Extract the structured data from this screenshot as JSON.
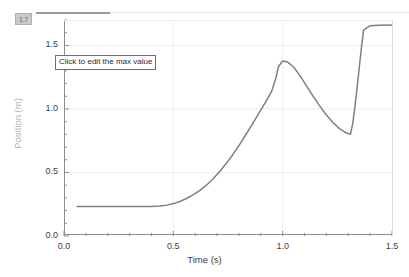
{
  "overlay": {
    "tooltip_text": "Click to edit the max value",
    "max_value_badge": "1.7"
  },
  "chart_data": {
    "type": "line",
    "title": "",
    "xlabel": "Time (s)",
    "ylabel": "Position (m)",
    "xlim": [
      0.0,
      1.5
    ],
    "ylim": [
      0.0,
      1.7
    ],
    "grid": true,
    "legend": "none",
    "line_color": "#808080",
    "x_major_ticks": [
      "0.0",
      "0.5",
      "1.0",
      "1.5"
    ],
    "x_major_values": [
      0.0,
      0.5,
      1.0,
      1.5
    ],
    "x_minor_step": 0.1,
    "y_major_ticks": [
      "0.0",
      "0.5",
      "1.0",
      "1.5"
    ],
    "y_major_values": [
      0.0,
      0.5,
      1.0,
      1.5
    ],
    "y_minor_step": 0.1,
    "series": [
      {
        "name": "Position",
        "x": [
          0.06,
          0.1,
          0.15,
          0.2,
          0.25,
          0.3,
          0.35,
          0.4,
          0.44,
          0.47,
          0.5,
          0.53,
          0.56,
          0.59,
          0.62,
          0.65,
          0.68,
          0.71,
          0.74,
          0.77,
          0.8,
          0.83,
          0.86,
          0.89,
          0.92,
          0.95,
          0.97,
          0.98,
          1.0,
          1.02,
          1.05,
          1.08,
          1.11,
          1.14,
          1.17,
          1.2,
          1.23,
          1.26,
          1.29,
          1.31,
          1.32,
          1.33,
          1.34,
          1.35,
          1.36,
          1.37,
          1.4,
          1.44,
          1.5
        ],
        "y": [
          0.232,
          0.232,
          0.232,
          0.232,
          0.232,
          0.232,
          0.232,
          0.233,
          0.236,
          0.243,
          0.255,
          0.272,
          0.295,
          0.323,
          0.357,
          0.398,
          0.447,
          0.503,
          0.566,
          0.636,
          0.712,
          0.793,
          0.877,
          0.963,
          1.048,
          1.14,
          1.25,
          1.33,
          1.378,
          1.372,
          1.33,
          1.26,
          1.178,
          1.098,
          1.022,
          0.952,
          0.893,
          0.845,
          0.812,
          0.8,
          0.88,
          1.01,
          1.16,
          1.32,
          1.48,
          1.62,
          1.655,
          1.658,
          1.66
        ]
      }
    ],
    "annotations": [
      {
        "kind": "plateau-start",
        "x": 0.06,
        "y": 0.232
      },
      {
        "kind": "peak",
        "x": 0.98,
        "y": 1.378
      },
      {
        "kind": "local-min",
        "x": 1.31,
        "y": 0.8
      },
      {
        "kind": "final-plateau",
        "x": 1.4,
        "y": 1.66
      }
    ]
  }
}
